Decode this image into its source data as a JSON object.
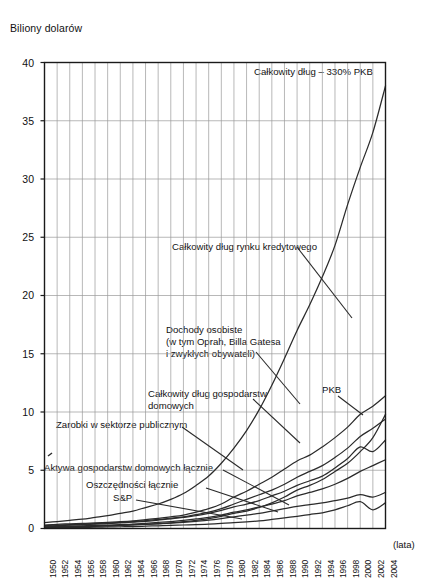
{
  "chart_data": {
    "type": "line",
    "title": "Biliony dolarów",
    "xlabel": "(lata)",
    "ylabel": "Biliony dolarów",
    "xlim": [
      1950,
      2004
    ],
    "ylim": [
      0,
      40
    ],
    "grid": true,
    "legend_position": "inline-annotations",
    "y_ticks": [
      "0",
      "5",
      "10",
      "15",
      "20",
      "25",
      "30",
      "35",
      "40"
    ],
    "y_tick_values": [
      0,
      5,
      10,
      15,
      20,
      25,
      30,
      35,
      40
    ],
    "x_ticks": [
      "1950",
      "1952",
      "1954",
      "1956",
      "1958",
      "1960",
      "1962",
      "1964",
      "1966",
      "1968",
      "1970",
      "1972",
      "1974",
      "1976",
      "1978",
      "1980",
      "1982",
      "1984",
      "1986",
      "1988",
      "1990",
      "1992",
      "1994",
      "1996",
      "1998",
      "2000",
      "2002",
      "2004"
    ],
    "x_tick_values": [
      1950,
      1952,
      1954,
      1956,
      1958,
      1960,
      1962,
      1964,
      1966,
      1968,
      1970,
      1972,
      1974,
      1976,
      1978,
      1980,
      1982,
      1984,
      1986,
      1988,
      1990,
      1992,
      1994,
      1996,
      1998,
      2000,
      2002,
      2004
    ],
    "x": [
      1950,
      1952,
      1954,
      1956,
      1958,
      1960,
      1962,
      1964,
      1966,
      1968,
      1970,
      1972,
      1974,
      1976,
      1978,
      1980,
      1982,
      1984,
      1986,
      1988,
      1990,
      1992,
      1994,
      1996,
      1998,
      2000,
      2002,
      2004
    ],
    "series": [
      {
        "name": "Całkowity dług rynku kredytowego",
        "values": [
          0.5,
          0.6,
          0.7,
          0.8,
          0.95,
          1.1,
          1.3,
          1.5,
          1.8,
          2.1,
          2.5,
          3.0,
          3.7,
          4.5,
          5.6,
          6.9,
          8.4,
          10.2,
          12.3,
          14.6,
          17.0,
          19.2,
          21.6,
          24.3,
          27.8,
          31.0,
          34.0,
          38.0
        ]
      },
      {
        "name": "Dochody osobiste (w tym Oprah, Billa Gatesa i zwykłych obywateli)",
        "values": [
          0.25,
          0.3,
          0.33,
          0.38,
          0.42,
          0.47,
          0.52,
          0.58,
          0.68,
          0.78,
          0.88,
          1.0,
          1.2,
          1.4,
          1.7,
          2.1,
          2.5,
          2.9,
          3.3,
          3.8,
          4.4,
          4.9,
          5.4,
          6.1,
          6.9,
          7.9,
          8.6,
          9.4
        ]
      },
      {
        "name": "Całkowity dług gospodarstw domowych",
        "values": [
          0.07,
          0.1,
          0.13,
          0.16,
          0.19,
          0.22,
          0.26,
          0.31,
          0.36,
          0.42,
          0.48,
          0.58,
          0.7,
          0.85,
          1.05,
          1.3,
          1.5,
          1.8,
          2.2,
          2.7,
          3.3,
          3.7,
          4.2,
          4.9,
          5.6,
          6.6,
          7.8,
          9.8
        ]
      },
      {
        "name": "Zarobki w sektorze publicznym",
        "values": [
          0.15,
          0.18,
          0.2,
          0.23,
          0.26,
          0.3,
          0.34,
          0.38,
          0.45,
          0.52,
          0.6,
          0.7,
          0.82,
          0.95,
          1.15,
          1.4,
          1.6,
          1.85,
          2.1,
          2.4,
          2.8,
          3.1,
          3.4,
          3.8,
          4.3,
          4.9,
          5.4,
          5.9
        ]
      },
      {
        "name": "Aktywa gospodarstw domowych łącznie",
        "values": [
          0.2,
          0.24,
          0.28,
          0.33,
          0.37,
          0.42,
          0.48,
          0.55,
          0.62,
          0.72,
          0.82,
          0.95,
          1.1,
          1.3,
          1.55,
          1.85,
          2.1,
          2.4,
          2.8,
          3.2,
          3.7,
          4.1,
          4.5,
          5.2,
          6.0,
          7.0,
          6.6,
          7.6
        ]
      },
      {
        "name": "Oszczędności łącznie",
        "values": [
          0.12,
          0.14,
          0.16,
          0.18,
          0.21,
          0.24,
          0.27,
          0.31,
          0.35,
          0.4,
          0.46,
          0.53,
          0.62,
          0.72,
          0.85,
          1.0,
          1.15,
          1.3,
          1.5,
          1.7,
          1.9,
          2.05,
          2.2,
          2.4,
          2.6,
          2.9,
          2.7,
          3.1
        ]
      },
      {
        "name": "S&P",
        "values": [
          0.05,
          0.07,
          0.08,
          0.1,
          0.11,
          0.13,
          0.15,
          0.17,
          0.2,
          0.23,
          0.26,
          0.3,
          0.33,
          0.38,
          0.43,
          0.5,
          0.57,
          0.65,
          0.78,
          0.92,
          1.05,
          1.2,
          1.35,
          1.6,
          1.95,
          2.3,
          1.6,
          2.2
        ]
      },
      {
        "name": "PKB",
        "values": [
          0.3,
          0.36,
          0.4,
          0.44,
          0.48,
          0.53,
          0.58,
          0.65,
          0.76,
          0.87,
          1.0,
          1.15,
          1.4,
          1.7,
          2.1,
          2.7,
          3.2,
          3.8,
          4.4,
          5.1,
          5.8,
          6.3,
          7.0,
          7.8,
          8.7,
          9.8,
          10.5,
          11.4
        ]
      }
    ],
    "annotations": [
      {
        "id": "total-debt-gdp",
        "text": "Całkowity dług – 330% PKB"
      },
      {
        "id": "credit-market-debt",
        "text": "Całkowity dług rynku kredytowego"
      },
      {
        "id": "personal-income-1",
        "text": "Dochody osobiste"
      },
      {
        "id": "personal-income-2",
        "text": "(w tym Oprah, Billa Gatesa"
      },
      {
        "id": "personal-income-3",
        "text": "i zwykłych obywateli)"
      },
      {
        "id": "household-debt-1",
        "text": "Całkowity dług gospodarstw"
      },
      {
        "id": "household-debt-2",
        "text": "domowych"
      },
      {
        "id": "public-sector-wages",
        "text": "Zarobki w sektorze publicznym"
      },
      {
        "id": "household-assets",
        "text": "Aktywa gospodarstw domowych łącznie"
      },
      {
        "id": "total-savings",
        "text": "Oszczędności łącznie"
      },
      {
        "id": "sp",
        "text": "S&P"
      },
      {
        "id": "gdp",
        "text": "PKB"
      }
    ]
  },
  "colors": {
    "axis": "#1a1a1a",
    "grid": "#9a9a9a",
    "curve": "#2b2b2b",
    "background": "#ffffff"
  }
}
